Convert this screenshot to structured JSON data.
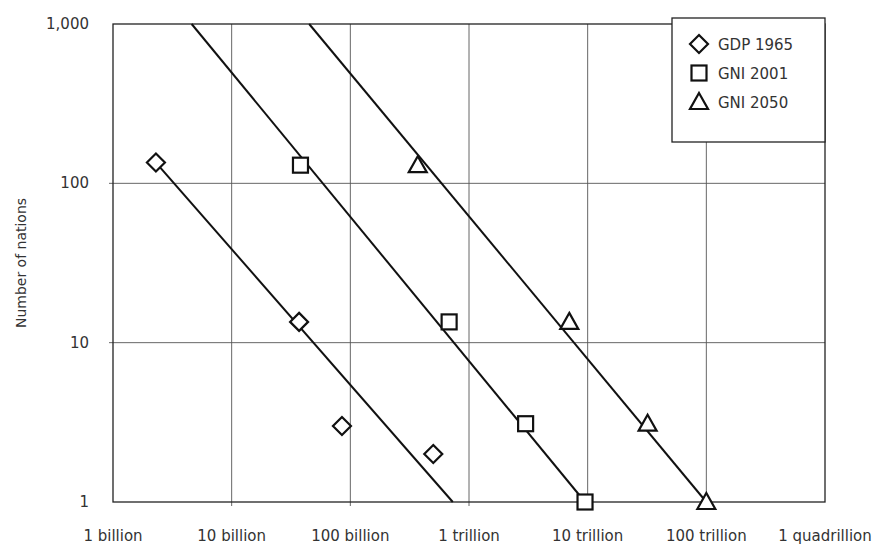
{
  "chart_data": {
    "type": "scatter",
    "title": "",
    "xlabel": "",
    "ylabel": "Number of nations",
    "xscale": "log",
    "yscale": "log",
    "xlim": [
      1000000000.0,
      1000000000000000.0
    ],
    "ylim": [
      1,
      1000
    ],
    "grid": true,
    "legend_position": "top-right",
    "x_ticks": [
      {
        "value": 1000000000.0,
        "label": "1 billion"
      },
      {
        "value": 10000000000.0,
        "label": "10 billion"
      },
      {
        "value": 100000000000.0,
        "label": "100 billion"
      },
      {
        "value": 1000000000000.0,
        "label": "1 trillion"
      },
      {
        "value": 10000000000000.0,
        "label": "10 trillion"
      },
      {
        "value": 100000000000000.0,
        "label": "100 trillion"
      },
      {
        "value": 1000000000000000.0,
        "label": "1 quadrillion"
      }
    ],
    "y_ticks": [
      {
        "value": 1,
        "label": "1"
      },
      {
        "value": 10,
        "label": "10"
      },
      {
        "value": 100,
        "label": "100"
      },
      {
        "value": 1000,
        "label": "1,000"
      }
    ],
    "series": [
      {
        "name": "GDP 1965",
        "legend_label": "GDP  1965",
        "marker": "diamond",
        "points": [
          {
            "x": 2300000000.0,
            "y": 135
          },
          {
            "x": 37000000000.0,
            "y": 13.5
          },
          {
            "x": 85000000000.0,
            "y": 3
          },
          {
            "x": 500000000000.0,
            "y": 2
          }
        ],
        "fit_line": [
          {
            "x": 2300000000.0,
            "y": 135
          },
          {
            "x": 730000000000.0,
            "y": 1
          }
        ]
      },
      {
        "name": "GNI 2001",
        "legend_label": "GNI  2001",
        "marker": "square",
        "points": [
          {
            "x": 38000000000.0,
            "y": 130
          },
          {
            "x": 680000000000.0,
            "y": 13.5
          },
          {
            "x": 3000000000000.0,
            "y": 3.1
          },
          {
            "x": 9500000000000.0,
            "y": 1
          }
        ],
        "fit_line": [
          {
            "x": 4600000000.0,
            "y": 1000
          },
          {
            "x": 9500000000000.0,
            "y": 1
          }
        ]
      },
      {
        "name": "GNI 2050",
        "legend_label": "GNI  2050",
        "marker": "triangle",
        "points": [
          {
            "x": 370000000000.0,
            "y": 130
          },
          {
            "x": 7000000000000.0,
            "y": 13.5
          },
          {
            "x": 32000000000000.0,
            "y": 3.1
          },
          {
            "x": 100000000000000.0,
            "y": 1
          }
        ],
        "fit_line": [
          {
            "x": 45000000000.0,
            "y": 1000
          },
          {
            "x": 100000000000000.0,
            "y": 1
          }
        ]
      }
    ]
  }
}
